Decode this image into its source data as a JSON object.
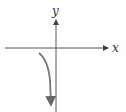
{
  "diagram": {
    "type": "function-graph",
    "axes": {
      "x_label": "x",
      "y_label": "y",
      "color": "#555555"
    },
    "curve": {
      "color": "#777777",
      "description": "decreasing branch in quadrant III approaching vertical asymptote from left, heading to negative infinity"
    }
  }
}
